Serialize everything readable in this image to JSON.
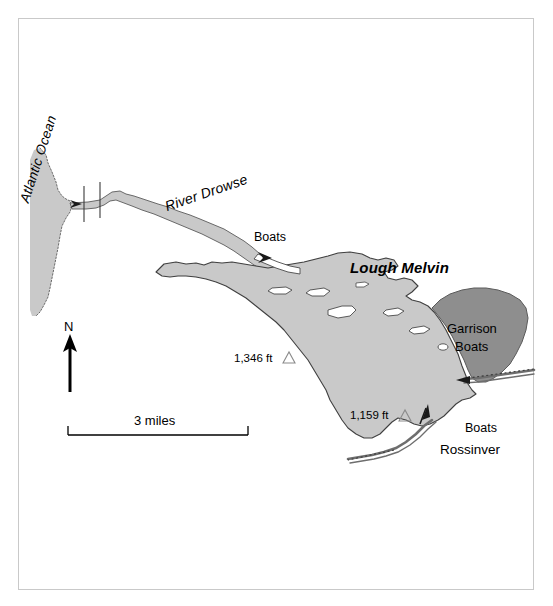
{
  "figure": {
    "kind": "map",
    "region": "Lough Melvin, Ireland"
  },
  "colors": {
    "water_light": "#c9c9c9",
    "water_dark": "#8e8e8e",
    "outline": "#4a4a4a",
    "frame": "#c9c9c9",
    "text": "#000000"
  },
  "labels": {
    "atlantic_ocean": "Atlantic Ocean",
    "river_drowse": "River Drowse",
    "lough_melvin": "Lough Melvin",
    "boats_northwest": "Boats",
    "garrison": "Garrison",
    "boats_garrison": "Boats",
    "boats_rossinver": "Boats",
    "rossinver": "Rossinver"
  },
  "elevations": [
    {
      "value": "1,346 ft",
      "symbol": "triangle"
    },
    {
      "value": "1,159 ft",
      "symbol": "triangle"
    }
  ],
  "north_arrow": {
    "label": "N"
  },
  "scale_bar": {
    "label": "3 miles",
    "distance": 3,
    "units": "miles"
  }
}
